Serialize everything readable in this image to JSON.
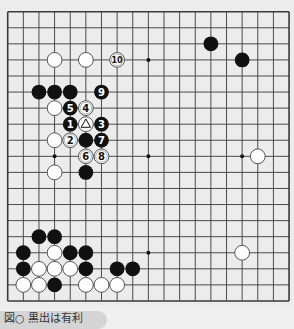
{
  "board": {
    "size": 19,
    "origin_x": 7.7,
    "origin_y": 11.7,
    "spacing_x": 15.63,
    "spacing_y": 16.07,
    "stone_radius": 7.4,
    "colors": {
      "background": "#ececec",
      "line": "#3a3a3a",
      "black_stone": "#111111",
      "white_stone": "#ffffff",
      "white_stroke": "#444444"
    },
    "star_points": [
      [
        3,
        3
      ],
      [
        9,
        3
      ],
      [
        15,
        3
      ],
      [
        3,
        9
      ],
      [
        9,
        9
      ],
      [
        15,
        9
      ],
      [
        3,
        15
      ],
      [
        9,
        15
      ],
      [
        15,
        15
      ]
    ],
    "stones": [
      {
        "color": "black",
        "col": 13,
        "row": 2
      },
      {
        "color": "black",
        "col": 15,
        "row": 3
      },
      {
        "color": "white",
        "col": 3,
        "row": 3
      },
      {
        "color": "white",
        "col": 5,
        "row": 3
      },
      {
        "color": "white",
        "col": 7,
        "row": 3,
        "label": "10"
      },
      {
        "color": "black",
        "col": 2,
        "row": 5
      },
      {
        "color": "black",
        "col": 3,
        "row": 5
      },
      {
        "color": "black",
        "col": 4,
        "row": 5
      },
      {
        "color": "black",
        "col": 6,
        "row": 5,
        "label": "9"
      },
      {
        "color": "white",
        "col": 3,
        "row": 6
      },
      {
        "color": "black",
        "col": 4,
        "row": 6,
        "label": "5"
      },
      {
        "color": "white",
        "col": 5,
        "row": 6,
        "label": "4"
      },
      {
        "color": "black",
        "col": 4,
        "row": 7,
        "label": "1"
      },
      {
        "color": "white",
        "col": 5,
        "row": 7,
        "mark": "triangle"
      },
      {
        "color": "black",
        "col": 6,
        "row": 7,
        "label": "3"
      },
      {
        "color": "white",
        "col": 3,
        "row": 8
      },
      {
        "color": "white",
        "col": 4,
        "row": 8,
        "label": "2"
      },
      {
        "color": "black",
        "col": 5,
        "row": 8
      },
      {
        "color": "black",
        "col": 6,
        "row": 8,
        "label": "7"
      },
      {
        "color": "white",
        "col": 5,
        "row": 9,
        "label": "6"
      },
      {
        "color": "white",
        "col": 6,
        "row": 9,
        "label": "8"
      },
      {
        "color": "white",
        "col": 3,
        "row": 10
      },
      {
        "color": "black",
        "col": 5,
        "row": 10
      },
      {
        "color": "white",
        "col": 16,
        "row": 9
      },
      {
        "color": "white",
        "col": 15,
        "row": 15
      },
      {
        "color": "black",
        "col": 2,
        "row": 14
      },
      {
        "color": "black",
        "col": 3,
        "row": 14
      },
      {
        "color": "black",
        "col": 1,
        "row": 15
      },
      {
        "color": "white",
        "col": 3,
        "row": 15
      },
      {
        "color": "black",
        "col": 4,
        "row": 15
      },
      {
        "color": "black",
        "col": 5,
        "row": 15
      },
      {
        "color": "black",
        "col": 1,
        "row": 16
      },
      {
        "color": "white",
        "col": 2,
        "row": 16
      },
      {
        "color": "white",
        "col": 3,
        "row": 16
      },
      {
        "color": "white",
        "col": 4,
        "row": 16
      },
      {
        "color": "black",
        "col": 5,
        "row": 16
      },
      {
        "color": "black",
        "col": 7,
        "row": 16
      },
      {
        "color": "black",
        "col": 8,
        "row": 16
      },
      {
        "color": "white",
        "col": 1,
        "row": 17
      },
      {
        "color": "white",
        "col": 2,
        "row": 17
      },
      {
        "color": "black",
        "col": 3,
        "row": 17
      },
      {
        "color": "white",
        "col": 5,
        "row": 17
      },
      {
        "color": "white",
        "col": 6,
        "row": 17
      },
      {
        "color": "white",
        "col": 7,
        "row": 17
      }
    ]
  },
  "caption": {
    "text": "図○ 黒出は有利"
  }
}
